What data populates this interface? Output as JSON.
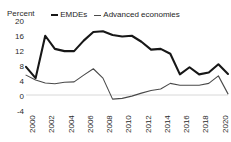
{
  "chart_data": {
    "type": "line",
    "title": "",
    "xlabel": "",
    "ylabel": "Percent",
    "ylim": [
      -4,
      20
    ],
    "xlim": [
      2000,
      2021
    ],
    "grid": false,
    "legend_position": "top-center",
    "ytick_labels": [
      "20",
      "16",
      "12",
      "8",
      "4",
      "0",
      "-4"
    ],
    "ytick_values": [
      20,
      16,
      12,
      8,
      4,
      0,
      -4
    ],
    "xtick_labels": [
      "2000",
      "2002",
      "2004",
      "2006",
      "2008",
      "2010",
      "2012",
      "2014",
      "2016",
      "2018",
      "2020"
    ],
    "xtick_values": [
      2000,
      2002,
      2004,
      2006,
      2008,
      2010,
      2012,
      2014,
      2016,
      2018,
      2020
    ],
    "x": [
      2000,
      2001,
      2002,
      2003,
      2004,
      2005,
      2006,
      2007,
      2008,
      2009,
      2010,
      2011,
      2012,
      2013,
      2014,
      2015,
      2016,
      2017,
      2018,
      2019,
      2020,
      2021
    ],
    "series": [
      {
        "name": "EMDEs",
        "color": "#171717",
        "values": [
          7.5,
          4.5,
          15.8,
          12.3,
          11.7,
          11.7,
          14.5,
          16.8,
          17.0,
          16.0,
          15.6,
          15.8,
          14.2,
          12.1,
          12.3,
          11.0,
          5.5,
          7.4,
          5.5,
          6.0,
          8.2,
          5.6
        ]
      },
      {
        "name": "Advanced economies",
        "color": "#4a4a4a",
        "values": [
          5.3,
          4.0,
          3.2,
          3.0,
          3.4,
          3.5,
          5.3,
          7.0,
          4.5,
          -1.1,
          -0.9,
          -0.3,
          0.5,
          1.2,
          1.6,
          3.1,
          2.6,
          2.6,
          2.6,
          3.1,
          5.1,
          0.3
        ]
      }
    ]
  },
  "legend": {
    "items": [
      {
        "label": "EMDEs",
        "marker": "line-marker-emdes"
      },
      {
        "label": "Advanced economies",
        "marker": "line-marker-advanced"
      }
    ]
  },
  "axes": {
    "unit_label": "Percent"
  }
}
